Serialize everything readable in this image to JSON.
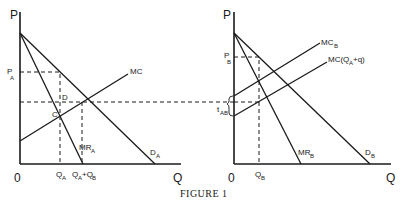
{
  "figure": {
    "caption": "FIGURE 1",
    "left_panel": {
      "y_axis_label": "P",
      "x_axis_label": "Q",
      "origin_label": "0",
      "price_label": "P",
      "price_sub": "A",
      "point_d": "D",
      "point_c": "C",
      "mc_label": "MC",
      "mr_label": "MR",
      "mr_sub": "A",
      "demand_label": "D",
      "demand_sub": "A",
      "qa_label": "Q",
      "qa_sub": "A",
      "qab_label_q1": "Q",
      "qab_sub1": "A",
      "qab_plus": "+Q",
      "qab_sub2": "B"
    },
    "right_panel": {
      "y_axis_label": "P",
      "x_axis_label": "Q",
      "origin_label": "0",
      "price_label": "P",
      "price_sub": "B",
      "tax_label": "t",
      "tax_sub": "AB",
      "mcb_label": "MC",
      "mcb_sub": "B",
      "mcq_label_pre": "MC(Q",
      "mcq_sub": "A",
      "mcq_label_post": "+q)",
      "mr_label": "MR",
      "mr_sub": "B",
      "demand_label": "D",
      "demand_sub": "B",
      "qb_label": "Q",
      "qb_sub": "B"
    }
  }
}
